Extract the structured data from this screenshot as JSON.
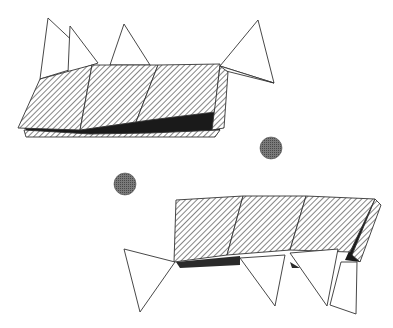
{
  "diagram": {
    "type": "crystal-structure-polyhedra",
    "background": "#ffffff",
    "stroke_color": "#333333",
    "hatch_color": "#444444",
    "shadow_color": "#1a1a1a",
    "sphere_color": "#6a6a6a",
    "layers": [
      {
        "name": "upper-octahedral-layer",
        "octahedra": 3,
        "tetrahedra": 4
      },
      {
        "name": "lower-octahedral-layer",
        "octahedra": 3,
        "tetrahedra": 4
      }
    ],
    "interlayer_cations": 2
  }
}
